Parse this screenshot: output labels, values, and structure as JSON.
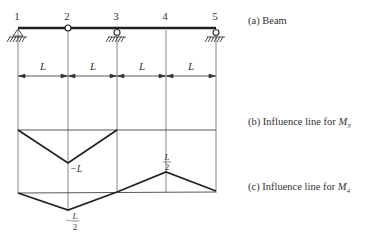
{
  "nodes": [
    {
      "id": "1",
      "x": 18,
      "support": "pin"
    },
    {
      "id": "2",
      "x": 68,
      "support": "hinge"
    },
    {
      "id": "3",
      "x": 117,
      "support": "roller"
    },
    {
      "id": "4",
      "x": 166,
      "support": "none"
    },
    {
      "id": "5",
      "x": 216,
      "support": "roller"
    }
  ],
  "spans": [
    {
      "label": "L"
    },
    {
      "label": "L"
    },
    {
      "label": "L"
    },
    {
      "label": "L"
    }
  ],
  "captions": {
    "a": "(a) Beam",
    "b_prefix": "(b) Influence line for ",
    "b_var": "M",
    "b_sub": "3",
    "c_prefix": "(c) Influence line for ",
    "c_var": "M",
    "c_sub": "4"
  },
  "influence_b": {
    "values": [
      0,
      "-L",
      0,
      0,
      0
    ],
    "label_min": "−L"
  },
  "influence_c": {
    "values": [
      0,
      "-L/2",
      0,
      "L/2",
      0
    ],
    "label_min_num": "L",
    "label_min_den": "2",
    "label_min_sign": "−",
    "label_max_num": "L",
    "label_max_den": "2"
  },
  "colors": {
    "line": "#222222",
    "thin": "#555555"
  }
}
